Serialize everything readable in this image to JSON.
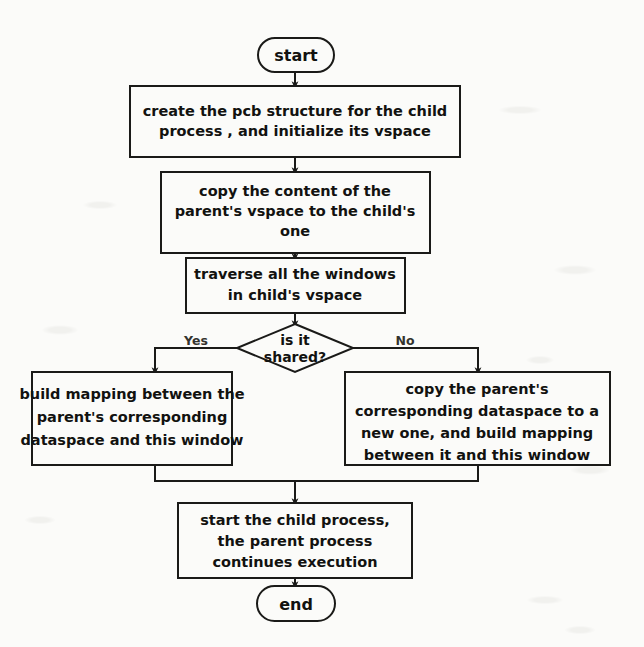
{
  "diagram": {
    "colors": {
      "stroke": "#1a1a18",
      "text": "#121210",
      "background": "#fbfbf9",
      "branch_label": "#33332e"
    },
    "nodes": {
      "start": {
        "type": "terminator",
        "label": "start"
      },
      "create_pcb": {
        "type": "process",
        "lines": [
          "create  the pcb structure for the child",
          "process , and initialize its vspace"
        ]
      },
      "copy_vspace": {
        "type": "process",
        "lines": [
          "copy the content of the",
          "parent's vspace to the child's",
          "one"
        ]
      },
      "traverse_windows": {
        "type": "process",
        "lines": [
          "traverse all the windows",
          "in child's vspace"
        ]
      },
      "is_shared": {
        "type": "decision",
        "lines": [
          "is it",
          "shared?"
        ]
      },
      "build_mapping": {
        "type": "process",
        "lines": [
          "build mapping between the",
          "parent's corresponding",
          "dataspace and this window"
        ]
      },
      "copy_dataspace": {
        "type": "process",
        "lines": [
          "copy the parent's",
          "corresponding dataspace to a",
          "new one, and build mapping",
          "between it and this window"
        ]
      },
      "start_child": {
        "type": "process",
        "lines": [
          "start the child process,",
          "the parent process",
          "continues execution"
        ]
      },
      "end": {
        "type": "terminator",
        "label": "end"
      }
    },
    "edge_labels": {
      "yes": "Yes",
      "no": "No"
    }
  }
}
